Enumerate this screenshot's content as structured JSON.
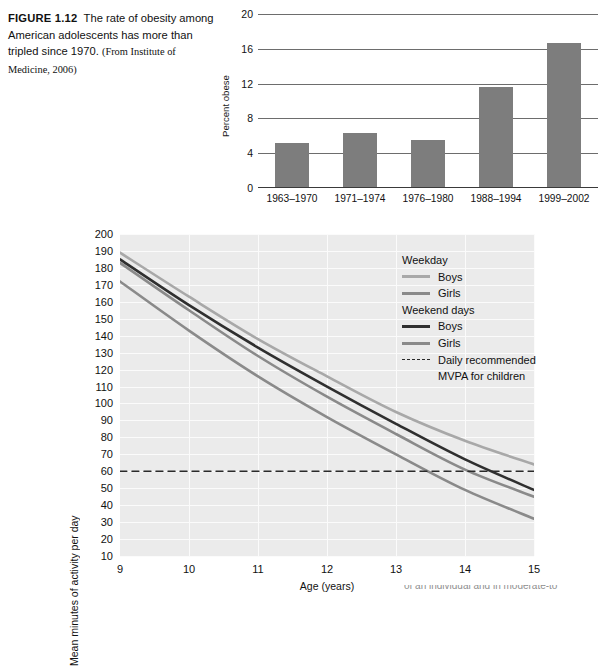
{
  "caption": {
    "figure_label": "FIGURE 1.12",
    "text": "The rate of obesity among American adolescents has more than tripled since 1970.",
    "source": "(From Institute of Medicine, 2006)"
  },
  "bottom_partial_caption": "of an individual and in moderate-to",
  "chart_data": [
    {
      "type": "bar",
      "title": "",
      "xlabel": "",
      "ylabel": "Percent obese",
      "categories": [
        "1963–1970",
        "1971–1974",
        "1976–1980",
        "1988–1994",
        "1999–2002"
      ],
      "values": [
        5.1,
        6.2,
        5.4,
        11.5,
        16.5
      ],
      "ylim": [
        0,
        20
      ],
      "yticks": [
        0,
        4,
        8,
        12,
        16,
        20
      ],
      "grid": "horizontal",
      "bar_color": "#7d7d7d",
      "legend": "none"
    },
    {
      "type": "line",
      "title": "",
      "xlabel": "Age (years)",
      "ylabel": "Mean minutes of activity per day",
      "x": [
        9,
        10,
        11,
        12,
        13,
        14,
        15
      ],
      "xlim": [
        9,
        15
      ],
      "xticks": [
        9,
        10,
        11,
        12,
        13,
        14,
        15
      ],
      "ylim": [
        10,
        200
      ],
      "yticks": [
        10,
        20,
        30,
        40,
        50,
        60,
        70,
        80,
        90,
        100,
        110,
        120,
        130,
        140,
        150,
        160,
        170,
        180,
        190,
        200
      ],
      "grid": "both",
      "plot_background": "#ebebeb",
      "legend_position": "upper right",
      "series": [
        {
          "name": "Weekday Boys",
          "group": "Weekday",
          "color": "#a8a8a8",
          "style": "solid",
          "values": [
            189,
            163,
            138,
            116,
            95,
            78,
            64
          ]
        },
        {
          "name": "Weekday Girls",
          "group": "Weekday",
          "color": "#8a8a8a",
          "style": "solid",
          "values": [
            183,
            155,
            128,
            104,
            82,
            61,
            45
          ]
        },
        {
          "name": "Weekend days Boys",
          "group": "Weekend days",
          "color": "#2f2f2f",
          "style": "solid",
          "values": [
            185,
            158,
            133,
            110,
            88,
            67,
            49
          ]
        },
        {
          "name": "Weekend days Girls",
          "group": "Weekend days",
          "color": "#8a8a8a",
          "style": "solid",
          "values": [
            172,
            143,
            116,
            92,
            70,
            49,
            32
          ]
        },
        {
          "name": "Daily recommended MVPA for children",
          "group": "reference",
          "color": "#2a2a2a",
          "style": "dashed",
          "values": [
            60,
            60,
            60,
            60,
            60,
            60,
            60
          ]
        }
      ]
    }
  ],
  "bar_chart": {
    "ylabel": "Percent obese",
    "yticks": [
      "0",
      "4",
      "8",
      "12",
      "16",
      "20"
    ],
    "categories": [
      "1963–1970",
      "1971–1974",
      "1976–1980",
      "1988–1994",
      "1999–2002"
    ]
  },
  "line_chart": {
    "ylabel": "Mean minutes of activity per day",
    "xlabel": "Age (years)",
    "yticks": [
      "200",
      "190",
      "180",
      "170",
      "160",
      "150",
      "140",
      "130",
      "120",
      "110",
      "100",
      "90",
      "80",
      "70",
      "60",
      "50",
      "40",
      "30",
      "20",
      "10"
    ],
    "xticks": [
      "9",
      "10",
      "11",
      "12",
      "13",
      "14",
      "15"
    ],
    "legend": {
      "weekday_head": "Weekday",
      "weekday_boys": "Boys",
      "weekday_girls": "Girls",
      "weekend_head": "Weekend days",
      "weekend_boys": "Boys",
      "weekend_girls": "Girls",
      "reference_line_1": "Daily recommended",
      "reference_line_2": "MVPA for children"
    }
  }
}
